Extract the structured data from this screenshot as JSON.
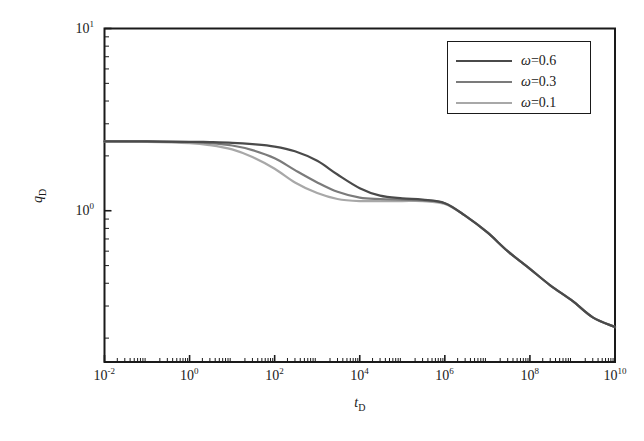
{
  "chart_data": {
    "type": "line",
    "title": "",
    "xlabel": "tD",
    "ylabel": "qD",
    "xscale": "log",
    "yscale": "log",
    "xlim": [
      0.01,
      10000000000
    ],
    "ylim": [
      0.1479,
      10
    ],
    "grid": false,
    "legend_position": "top-right",
    "xticks": [
      {
        "value": 0.01,
        "mantissa": "10",
        "exponent": "-2"
      },
      {
        "value": 1,
        "mantissa": "10",
        "exponent": "0"
      },
      {
        "value": 100,
        "mantissa": "10",
        "exponent": "2"
      },
      {
        "value": 10000,
        "mantissa": "10",
        "exponent": "4"
      },
      {
        "value": 1000000,
        "mantissa": "10",
        "exponent": "6"
      },
      {
        "value": 100000000,
        "mantissa": "10",
        "exponent": "8"
      },
      {
        "value": 10000000000,
        "mantissa": "10",
        "exponent": "10"
      }
    ],
    "yticks": [
      {
        "value": 10,
        "mantissa": "10",
        "exponent": "1"
      },
      {
        "value": 1,
        "mantissa": "10",
        "exponent": "0"
      }
    ],
    "series": [
      {
        "name": "w=0.6",
        "legend_label_prefix": "ω",
        "legend_label_suffix": "=0.6",
        "color": "#4a4a4a",
        "linewidth": 2.2,
        "points": [
          [
            0.01,
            2.4
          ],
          [
            0.1,
            2.4
          ],
          [
            1,
            2.39
          ],
          [
            3,
            2.38
          ],
          [
            10,
            2.36
          ],
          [
            30,
            2.32
          ],
          [
            100,
            2.25
          ],
          [
            300,
            2.12
          ],
          [
            1000,
            1.88
          ],
          [
            3000,
            1.58
          ],
          [
            10000,
            1.33
          ],
          [
            30000,
            1.21
          ],
          [
            100000,
            1.17
          ],
          [
            300000,
            1.15
          ],
          [
            1000000,
            1.1
          ],
          [
            3000000,
            0.94
          ],
          [
            10000000,
            0.76
          ],
          [
            30000000,
            0.6
          ],
          [
            100000000,
            0.48
          ],
          [
            300000000,
            0.39
          ],
          [
            1000000000,
            0.32
          ],
          [
            3000000000,
            0.26
          ],
          [
            10000000000,
            0.23
          ]
        ]
      },
      {
        "name": "w=0.3",
        "legend_label_prefix": "ω",
        "legend_label_suffix": "=0.3",
        "color": "#7b7b7b",
        "linewidth": 2.2,
        "points": [
          [
            0.01,
            2.4
          ],
          [
            0.1,
            2.4
          ],
          [
            1,
            2.38
          ],
          [
            3,
            2.35
          ],
          [
            10,
            2.28
          ],
          [
            30,
            2.15
          ],
          [
            100,
            1.94
          ],
          [
            300,
            1.67
          ],
          [
            1000,
            1.43
          ],
          [
            3000,
            1.27
          ],
          [
            10000,
            1.18
          ],
          [
            30000,
            1.16
          ],
          [
            100000,
            1.15
          ],
          [
            300000,
            1.14
          ],
          [
            1000000,
            1.1
          ],
          [
            3000000,
            0.94
          ],
          [
            10000000,
            0.76
          ],
          [
            30000000,
            0.6
          ],
          [
            100000000,
            0.48
          ],
          [
            300000000,
            0.39
          ],
          [
            1000000000,
            0.32
          ],
          [
            3000000000,
            0.26
          ],
          [
            10000000000,
            0.23
          ]
        ]
      },
      {
        "name": "w=0.1",
        "legend_label_prefix": "ω",
        "legend_label_suffix": "=0.1",
        "color": "#a8a8a8",
        "linewidth": 2.2,
        "points": [
          [
            0.01,
            2.4
          ],
          [
            0.1,
            2.39
          ],
          [
            1,
            2.35
          ],
          [
            3,
            2.29
          ],
          [
            10,
            2.17
          ],
          [
            30,
            1.97
          ],
          [
            100,
            1.7
          ],
          [
            300,
            1.43
          ],
          [
            1000,
            1.25
          ],
          [
            3000,
            1.16
          ],
          [
            10000,
            1.13
          ],
          [
            30000,
            1.13
          ],
          [
            100000,
            1.13
          ],
          [
            300000,
            1.13
          ],
          [
            1000000,
            1.09
          ],
          [
            3000000,
            0.94
          ],
          [
            10000000,
            0.76
          ],
          [
            30000000,
            0.6
          ],
          [
            100000000,
            0.48
          ],
          [
            300000000,
            0.39
          ],
          [
            1000000000,
            0.32
          ],
          [
            3000000000,
            0.26
          ],
          [
            10000000000,
            0.23
          ]
        ]
      }
    ]
  },
  "axes": {
    "x_label_mantissa": "t",
    "x_label_sub": "D",
    "y_label_mantissa": "q",
    "y_label_sub": "D"
  },
  "legend": {
    "entries": [
      {
        "label": "ω=0.6"
      },
      {
        "label": "ω=0.3"
      },
      {
        "label": "ω=0.1"
      }
    ]
  },
  "style": {
    "frame_color": "#1a1a1a",
    "background": "#ffffff"
  }
}
